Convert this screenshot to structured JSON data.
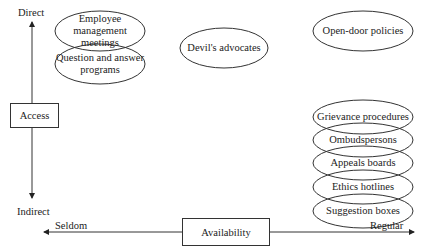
{
  "axes": {
    "vertical": {
      "title": "Access",
      "top_label": "Direct",
      "bottom_label": "Indirect"
    },
    "horizontal": {
      "title": "Availability",
      "left_label": "Seldom",
      "right_label": "Regular"
    }
  },
  "nodes": [
    {
      "id": "employee-management-meetings",
      "label": "Employee management meetings",
      "line1": "Employee management",
      "line2": "meetings",
      "cx": 100,
      "cy": 31,
      "rx": 45,
      "ry": 20
    },
    {
      "id": "question-and-answer-programs",
      "label": "Question and answer programs",
      "line1": "Question and answer",
      "line2": "programs",
      "cx": 100,
      "cy": 64,
      "rx": 45,
      "ry": 20
    },
    {
      "id": "devils-advocates",
      "label": "Devil's advocates",
      "cx": 224,
      "cy": 48,
      "rx": 44,
      "ry": 20
    },
    {
      "id": "open-door-policies",
      "label": "Open-door policies",
      "cx": 363,
      "cy": 31,
      "rx": 50,
      "ry": 20
    },
    {
      "id": "grievance-procedures",
      "label": "Grievance procedures",
      "cx": 363,
      "cy": 117,
      "rx": 50,
      "ry": 17
    },
    {
      "id": "ombudspersons",
      "label": "Ombudspersons",
      "cx": 363,
      "cy": 140,
      "rx": 50,
      "ry": 17
    },
    {
      "id": "appeals-boards",
      "label": "Appeals boards",
      "cx": 363,
      "cy": 163,
      "rx": 50,
      "ry": 17
    },
    {
      "id": "ethics-hotlines",
      "label": "Ethics hotlines",
      "cx": 363,
      "cy": 187,
      "rx": 50,
      "ry": 17
    },
    {
      "id": "suggestion-boxes",
      "label": "Suggestion boxes",
      "cx": 363,
      "cy": 211,
      "rx": 50,
      "ry": 17
    }
  ],
  "colors": {
    "stroke": "#333333",
    "text": "#222222",
    "background": "#ffffff"
  }
}
